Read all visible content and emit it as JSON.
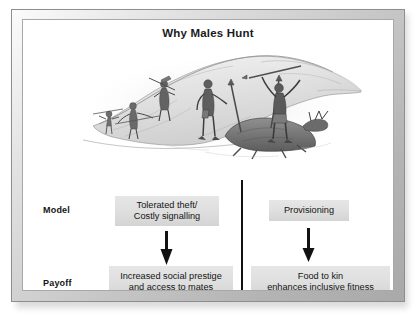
{
  "figure": {
    "title": "Why Males Hunt",
    "illustration_alt": "pencil-sketch of prehistoric male hunters with spears descending a hillside toward a fallen deer, one hunter raising arms in triumph",
    "rows": [
      {
        "key": "model",
        "label": "Model"
      },
      {
        "key": "payoff",
        "label": "Payoff"
      }
    ],
    "columns": [
      {
        "key": "left",
        "model": {
          "line1": "Tolerated theft/",
          "line2": "Costly signalling"
        },
        "payoff": {
          "line1": "Increased social prestige",
          "line2": "and access to mates"
        },
        "arrow": "down-arrow-icon"
      },
      {
        "key": "right",
        "model": {
          "line1": "Provisioning",
          "line2": ""
        },
        "payoff": {
          "line1": "Food to kin",
          "line2": "enhances inclusive fitness"
        },
        "arrow": "down-arrow-icon"
      }
    ],
    "colors": {
      "box_fill": "#dedede",
      "frame_light": "#fbfbfb",
      "frame_dark": "#a9a9a9",
      "canvas": "#ffffff",
      "ink": "#141414",
      "divider": "#111111"
    }
  }
}
